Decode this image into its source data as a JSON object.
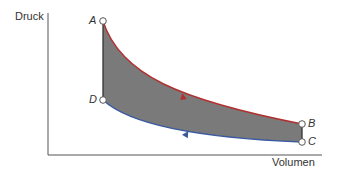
{
  "diagram": {
    "type": "pv-diagram",
    "y_axis_label": "Druck",
    "x_axis_label": "Volumen",
    "points": [
      {
        "id": "A",
        "label": "A",
        "x": 103,
        "y": 21
      },
      {
        "id": "B",
        "label": "B",
        "x": 302,
        "y": 124
      },
      {
        "id": "C",
        "label": "C",
        "x": 302,
        "y": 142
      },
      {
        "id": "D",
        "label": "D",
        "x": 103,
        "y": 100
      }
    ],
    "colors": {
      "fill": "#7a7a7a",
      "expansion_curve": "#b03030",
      "compression_curve": "#3a5aa0",
      "axis": "#555555",
      "point_outline": "#555555"
    },
    "processes": [
      {
        "from": "A",
        "to": "B",
        "color": "expansion",
        "direction_arrow": "right"
      },
      {
        "from": "B",
        "to": "C",
        "color": "neutral"
      },
      {
        "from": "C",
        "to": "D",
        "color": "compression",
        "direction_arrow": "left"
      },
      {
        "from": "D",
        "to": "A",
        "color": "neutral"
      }
    ]
  }
}
